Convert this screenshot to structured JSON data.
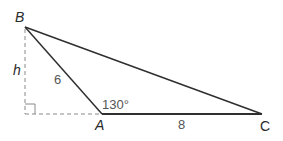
{
  "diagram": {
    "type": "triangle",
    "vertices": {
      "B": {
        "label": "B",
        "x": 25,
        "y": 27
      },
      "A": {
        "label": "A",
        "x": 102,
        "y": 114
      },
      "C": {
        "label": "C",
        "x": 262,
        "y": 114
      },
      "foot": {
        "x": 25,
        "y": 114
      }
    },
    "labels": {
      "B": "B",
      "A": "A",
      "C": "C",
      "height": "h",
      "side_AB": "6",
      "side_AC": "8",
      "angle_A": "130°"
    },
    "colors": {
      "line": "#2f2f2f",
      "dashed": "#777777",
      "text": "#2a2a2a",
      "number": "#555555"
    }
  }
}
